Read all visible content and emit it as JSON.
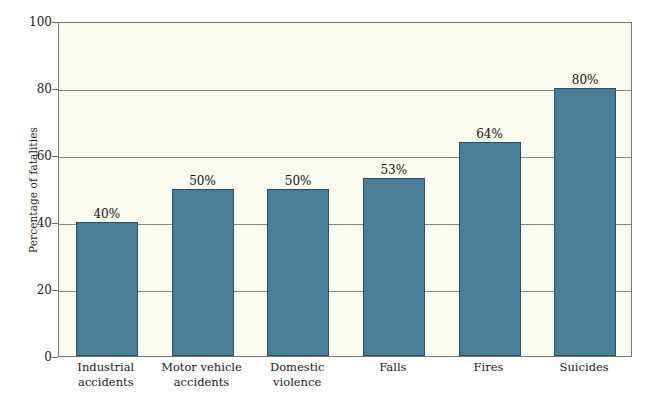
{
  "chart_data": {
    "type": "bar",
    "title": "",
    "xlabel": "",
    "ylabel": "Percentage of fatalities",
    "ylim": [
      0,
      100
    ],
    "ytick_step": 20,
    "yticks": [
      0,
      20,
      40,
      60,
      80,
      100
    ],
    "ytick_labels": [
      "0",
      "20",
      "40",
      "60",
      "80",
      "100"
    ],
    "grid": true,
    "grid_axis": "y",
    "legend": false,
    "categories": [
      "Industrial accidents",
      "Motor vehicle accidents",
      "Domestic violence",
      "Falls",
      "Fires",
      "Suicides"
    ],
    "category_lines": [
      [
        "Industrial",
        "accidents"
      ],
      [
        "Motor vehicle",
        "accidents"
      ],
      [
        "Domestic",
        "violence"
      ],
      [
        "Falls"
      ],
      [
        "Fires"
      ],
      [
        "Suicides"
      ]
    ],
    "values": [
      40,
      50,
      50,
      53,
      64,
      80
    ],
    "value_labels": [
      "40%",
      "50%",
      "50%",
      "53%",
      "64%",
      "80%"
    ],
    "colors": {
      "bar_fill": "#4a7d97",
      "bar_stroke": "#2c4e60",
      "plot_background": "#fafaee",
      "plot_border": "#78786a",
      "gridline": "#84847a",
      "page_background": "#ffffff",
      "text": "#1a1a1a"
    }
  }
}
